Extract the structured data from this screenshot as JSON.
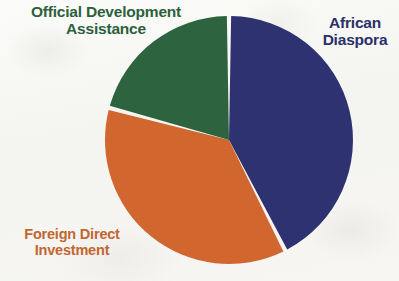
{
  "figure": {
    "background_color": "#f6f6f4",
    "width": 399,
    "height": 281
  },
  "labels": {
    "oda": {
      "line1": "Official Development",
      "line2": "Assistance",
      "color": "#2e5f3d"
    },
    "diaspora": {
      "line1": "African",
      "line2": "Diaspora",
      "color": "#2b3068"
    },
    "fdi": {
      "line1": "Foreign Direct",
      "line2": "Investment",
      "color": "#c2662f"
    }
  },
  "chart_data": {
    "type": "pie",
    "title": "",
    "subtitle": "",
    "xlabel": "",
    "ylabel": "",
    "legend_position": "none",
    "labels_position": "outside-callout",
    "grid": false,
    "center": [
      229,
      140
    ],
    "radius": 124,
    "start_angle_deg": 0,
    "direction": "clockwise",
    "slice_gap_deg": 2,
    "categories": [
      "African Diaspora",
      "Foreign Direct Investment",
      "Official Development Assistance"
    ],
    "values": [
      42,
      37,
      21
    ],
    "value_unit": "percent",
    "colors": [
      "#2e3270",
      "#d1662f",
      "#2e6340"
    ],
    "slices": [
      {
        "name": "African Diaspora",
        "value": 42,
        "color": "#2e3270",
        "start_angle_deg": 1,
        "end_angle_deg": 152
      },
      {
        "name": "Foreign Direct Investment",
        "value": 37,
        "color": "#d1662f",
        "start_angle_deg": 154,
        "end_angle_deg": 284
      },
      {
        "name": "Official Development Assistance",
        "value": 21,
        "color": "#2e6340",
        "start_angle_deg": 286,
        "end_angle_deg": 359
      }
    ],
    "annotations": []
  }
}
